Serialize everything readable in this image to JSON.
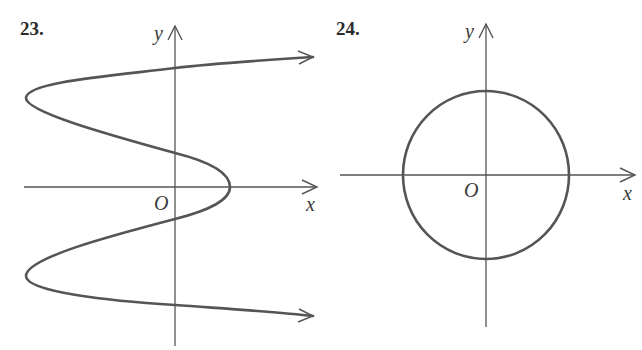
{
  "figures": [
    {
      "number": "23.",
      "x_label": "x",
      "y_label": "y",
      "origin_label": "O",
      "description": "S-shaped curve x as function of y, oscillating; both ends extend to the right with arrows"
    },
    {
      "number": "24.",
      "x_label": "x",
      "y_label": "y",
      "origin_label": "O",
      "description": "Circle centered at the origin"
    }
  ],
  "colors": {
    "stroke": "#555555",
    "text": "#2a2a2a",
    "background": "#ffffff"
  }
}
